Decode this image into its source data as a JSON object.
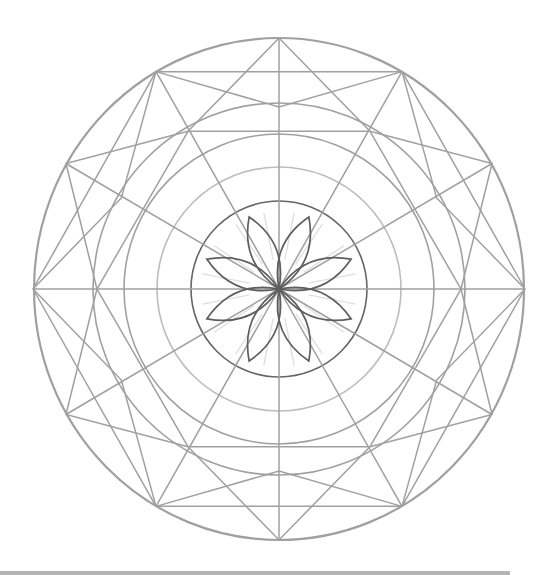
{
  "diagram": {
    "type": "mandala-line-drawing",
    "center": [
      279,
      289
    ],
    "colors": {
      "background": "#ffffff",
      "structure_line": "#a0a0a0",
      "light_ring": "#bdbdbd",
      "inner_circle": "#666666",
      "petal": "#5e5e5e",
      "ray": "#dedede",
      "bottom_bar": "#b4b4b4"
    },
    "rings": [
      {
        "name": "outer-ring",
        "rx": 245,
        "ry": 251
      },
      {
        "name": "ring-3",
        "r": 186
      },
      {
        "name": "ring-2",
        "r": 155
      },
      {
        "name": "ring-1-light",
        "r": 122
      },
      {
        "name": "inner-circle",
        "r": 88
      }
    ],
    "spokes": 12,
    "star_points": 12,
    "petals": 8,
    "petal_length": 78
  }
}
